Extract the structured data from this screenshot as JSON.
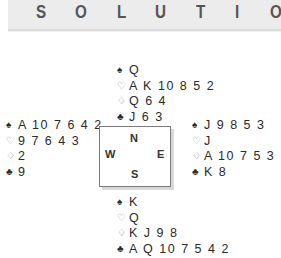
{
  "header": {
    "title_letters": [
      "S",
      "O",
      "L",
      "U",
      "T",
      "I",
      "O"
    ]
  },
  "compass": {
    "north": "N",
    "west": "W",
    "east": "E",
    "south": "S"
  },
  "suits": {
    "spades": "♠",
    "hearts": "♡",
    "diamonds": "♢",
    "clubs": "♣"
  },
  "hands": {
    "north": {
      "spades": "Q",
      "hearts": "A K 10 8 5 2",
      "diamonds": "Q 6 4",
      "clubs": "J 6 3"
    },
    "west": {
      "spades": "A 10 7 6 4 2",
      "hearts": "9 7 6 4 3",
      "diamonds": "2",
      "clubs": "9"
    },
    "east": {
      "spades": "J 9 8 5 3",
      "hearts": "J",
      "diamonds": "A 10 7 5 3",
      "clubs": "K 8"
    },
    "south": {
      "spades": "K",
      "hearts": "Q",
      "diamonds": "K J 9 8",
      "clubs": "A Q 10 7 5 4 2"
    }
  }
}
